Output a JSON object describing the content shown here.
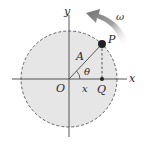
{
  "diagram": {
    "labels": {
      "y_axis": "y",
      "x_axis": "x",
      "origin": "O",
      "point_p": "P",
      "point_q": "Q",
      "radius": "A",
      "angle": "θ",
      "projection": "x",
      "angular_velocity": "ω"
    },
    "colors": {
      "circle_fill": "#e6e6e6",
      "circle_stroke": "#555555",
      "axis": "#444444",
      "point": "#222222",
      "arrow": "#8a8a8a"
    }
  }
}
